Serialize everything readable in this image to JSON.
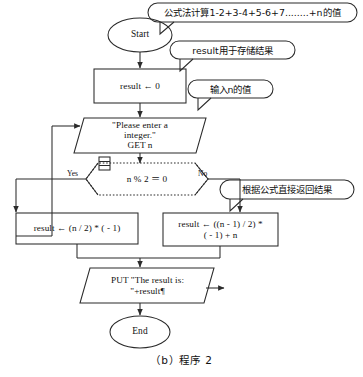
{
  "figure": {
    "caption": "（b）程序 2",
    "line_color": "#2b2b2b",
    "text_color": "#101010",
    "background": "#ffffff"
  },
  "nodes": {
    "start": {
      "label": "Start",
      "shape": "terminator-ellipse"
    },
    "init": {
      "label": "result ← 0",
      "shape": "process-rect"
    },
    "input": {
      "line1": "\"Please enter a",
      "line2": "integer.\"",
      "line3": "GET n",
      "shape": "io-parallelogram"
    },
    "decision": {
      "label": "n % 2 ＝ 0",
      "shape": "decision-diamond",
      "yes_label": "Yes",
      "no_label": "No"
    },
    "process_even": {
      "label": "result ← (n / 2) * ( - 1)",
      "shape": "process-rect"
    },
    "process_odd": {
      "line1": "result ← ((n - 1) / 2) *",
      "line2": "( - 1) + n",
      "shape": "process-rect"
    },
    "output": {
      "line1": "PUT \"The result is:",
      "line2": "\"+result¶",
      "shape": "io-parallelogram"
    },
    "end": {
      "label": "End",
      "shape": "terminator-ellipse"
    }
  },
  "callouts": [
    {
      "name": "callout-formula",
      "text": "公式法计算1-2+3-4+5-6+7........+n的值"
    },
    {
      "name": "callout-result-var",
      "text": "result用于存储结果"
    },
    {
      "name": "callout-input-n",
      "text": "输入n的值"
    },
    {
      "name": "callout-return-result",
      "text": "根据公式直接返回结果"
    }
  ]
}
